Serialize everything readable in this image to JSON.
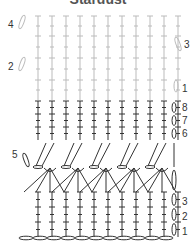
{
  "title": "Stardust",
  "labels": {
    "upper": [
      {
        "text": "4",
        "x": 8,
        "y": 28
      },
      {
        "text": "3",
        "x": 184,
        "y": 48
      },
      {
        "text": "2",
        "x": 8,
        "y": 70
      },
      {
        "text": "1",
        "x": 182,
        "y": 92
      }
    ],
    "middle": [
      {
        "text": "8",
        "x": 182,
        "y": 111
      },
      {
        "text": "7",
        "x": 182,
        "y": 124
      },
      {
        "text": "6",
        "x": 182,
        "y": 137
      },
      {
        "text": "5",
        "x": 12,
        "y": 158
      }
    ],
    "lower": [
      {
        "text": "3",
        "x": 182,
        "y": 205
      },
      {
        "text": "2",
        "x": 182,
        "y": 220
      },
      {
        "text": "1",
        "x": 182,
        "y": 235
      }
    ]
  },
  "colors": {
    "light": "#bbbbbb",
    "dark": "#333333"
  }
}
